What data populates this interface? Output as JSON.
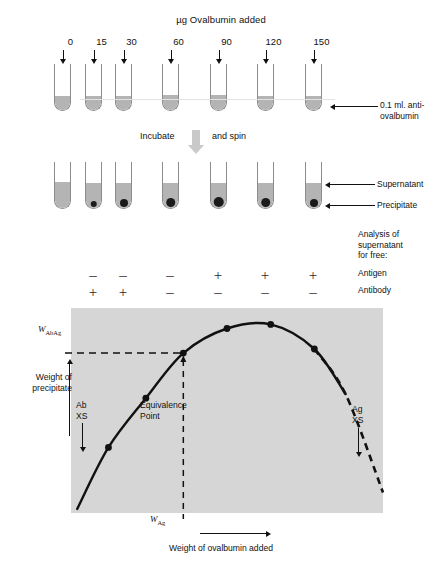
{
  "figure": {
    "top_title": "µg Ovalbumin added",
    "process_label_left": "Incubate",
    "process_label_right": "and spin",
    "callouts": {
      "antiserum": "0.1 ml. anti-\novalbumin",
      "supernatant": "Supernatant",
      "precipitate": "Precipitate"
    }
  },
  "tubes": {
    "dose_labels": [
      "0",
      "15",
      "30",
      "60",
      "90",
      "120",
      "150"
    ],
    "x_positions": [
      62,
      93,
      123,
      170,
      218,
      265,
      313
    ],
    "row1": {
      "top": 64,
      "height": 47,
      "liquid_heights": [
        14,
        14,
        14,
        15,
        15,
        14,
        14
      ]
    },
    "row2": {
      "top": 162,
      "height": 47,
      "liquid_heights": [
        26,
        25,
        25,
        25,
        25,
        25,
        25
      ],
      "pellet_sizes": [
        0,
        6.5,
        8,
        9.5,
        10.5,
        9.5,
        8
      ]
    }
  },
  "analysis": {
    "heading": "Analysis of\nsupernatant\nfor free:",
    "row_labels": [
      "Antigen",
      "Antibody"
    ],
    "antigen": [
      "",
      "–",
      "–",
      "–",
      "+",
      "+",
      "+"
    ],
    "antibody": [
      "",
      "+",
      "+",
      "–",
      "–",
      "–",
      "–"
    ]
  },
  "chart_data": {
    "type": "line",
    "title": "",
    "xlabel": "Weight of ovalbumin added",
    "ylabel": "Weight of\nprecipitate",
    "xlim": [
      0,
      100
    ],
    "ylim": [
      0,
      100
    ],
    "grid": false,
    "series": [
      {
        "name": "precipitin curve",
        "x": [
          2,
          12,
          24,
          36,
          50,
          64,
          78,
          88,
          100
        ],
        "values": [
          2,
          32,
          56,
          78,
          90,
          92,
          80,
          58,
          10
        ],
        "solid_through_index": 7,
        "dashed_tail": true
      }
    ],
    "markers": {
      "x": [
        12,
        24,
        36,
        50,
        64,
        78
      ],
      "values": [
        32,
        56,
        78,
        90,
        92,
        80
      ]
    },
    "annotations": {
      "equivalence_label": "Equivalence\nPoint",
      "w_abag": "W",
      "w_abag_sub": "AbAg",
      "w_ag": "W",
      "w_ag_sub": "Ag",
      "ab_excess": "Ab\nXS",
      "ag_excess": "Ag\nXS"
    },
    "plot_area": {
      "left": 71,
      "top": 308,
      "width": 312,
      "height": 205
    },
    "colors": {
      "background": "#d6d6d6",
      "curve": "#111111",
      "marker": "#111111"
    }
  }
}
